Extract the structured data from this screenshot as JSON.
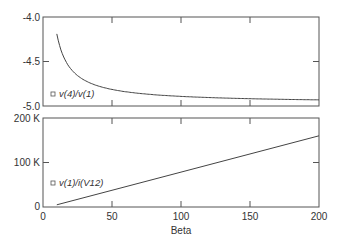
{
  "chart_data": [
    {
      "type": "line",
      "title": "",
      "xlabel": "",
      "ylabel": "",
      "xlim": [
        0,
        200
      ],
      "ylim": [
        -5.0,
        -4.0
      ],
      "yticks": [
        "-4.0",
        "-4.5",
        "-5.0"
      ],
      "grid": false,
      "legend": "v(4)/v(1)",
      "series": [
        {
          "name": "v(4)/v(1)",
          "x": [
            10,
            15,
            20,
            30,
            40,
            50,
            60,
            80,
            100,
            125,
            150,
            175,
            200
          ],
          "values": [
            -4.19,
            -4.45,
            -4.58,
            -4.72,
            -4.79,
            -4.83,
            -4.86,
            -4.89,
            -4.91,
            -4.93,
            -4.94,
            -4.945,
            -4.95
          ]
        }
      ]
    },
    {
      "type": "line",
      "title": "",
      "xlabel": "Beta",
      "ylabel": "",
      "xlim": [
        0,
        200
      ],
      "ylim": [
        0,
        200000
      ],
      "xticks": [
        "0",
        "50",
        "100",
        "150",
        "200"
      ],
      "yticks": [
        "200 K",
        "100 K",
        "0"
      ],
      "grid": false,
      "legend": "v(1)/i(V12)",
      "series": [
        {
          "name": "v(1)/i(V12)",
          "x": [
            10,
            200
          ],
          "values": [
            5000,
            160000
          ]
        }
      ]
    }
  ],
  "labels": {
    "top_y_ticks": [
      "-4.0",
      "-4.5",
      "-5.0"
    ],
    "top_legend": "v(4)/v(1)",
    "bottom_y_ticks": [
      "200 K",
      "100 K",
      "0"
    ],
    "bottom_legend": "v(1)/i(V12)",
    "x_ticks": [
      "0",
      "50",
      "100",
      "150",
      "200"
    ],
    "x_label": "Beta"
  }
}
